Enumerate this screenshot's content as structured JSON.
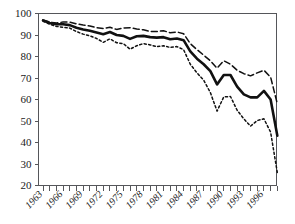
{
  "chart_data": {
    "type": "line",
    "title": "",
    "subtitle": "",
    "xlabel": "",
    "ylabel": "",
    "xlim": [
      1963,
      1998
    ],
    "ylim": [
      20,
      100
    ],
    "grid": false,
    "legend_position": "none",
    "y_ticks": [
      20,
      30,
      40,
      50,
      60,
      70,
      80,
      90,
      100
    ],
    "y_tick_labels": [
      "20",
      "30",
      "40",
      "50",
      "60",
      "70",
      "80",
      "90",
      "100"
    ],
    "x": [
      1963,
      1964,
      1965,
      1966,
      1967,
      1968,
      1969,
      1970,
      1971,
      1972,
      1973,
      1974,
      1975,
      1976,
      1977,
      1978,
      1979,
      1980,
      1981,
      1982,
      1983,
      1984,
      1985,
      1986,
      1987,
      1988,
      1989,
      1990,
      1991,
      1992,
      1993,
      1994,
      1995,
      1996,
      1997,
      1998
    ],
    "x_tick_labels": [
      "1963",
      "",
      "",
      "1966",
      "",
      "",
      "1969",
      "",
      "",
      "1972",
      "",
      "",
      "1975",
      "",
      "",
      "1978",
      "",
      "",
      "1981",
      "",
      "",
      "1984",
      "",
      "",
      "1987",
      "",
      "",
      "1990",
      "",
      "",
      "1993",
      "",
      "",
      "1996",
      "",
      ""
    ],
    "x_labeled_years": [
      "1963",
      "1966",
      "1969",
      "1972",
      "1975",
      "1978",
      "1981",
      "1984",
      "1987",
      "1990",
      "1993",
      "1996"
    ],
    "series": [
      {
        "name": "upper-confidence-bound",
        "style": "dashed",
        "color": "#111111",
        "values": [
          97.0,
          96.0,
          95.6,
          96.0,
          96.0,
          95.2,
          94.6,
          94.2,
          93.4,
          93.0,
          93.6,
          92.6,
          93.2,
          93.4,
          92.8,
          92.4,
          91.6,
          91.6,
          92.0,
          91.0,
          91.4,
          90.6,
          86.0,
          83.2,
          80.6,
          78.0,
          74.6,
          78.0,
          76.4,
          73.6,
          72.0,
          71.0,
          72.4,
          73.6,
          70.4,
          58.0
        ]
      },
      {
        "name": "point-estimate",
        "style": "solid",
        "color": "#111111",
        "values": [
          96.8,
          95.6,
          95.0,
          95.0,
          94.6,
          93.4,
          92.6,
          92.0,
          91.2,
          90.4,
          91.4,
          90.0,
          89.6,
          88.2,
          89.4,
          89.6,
          89.0,
          88.8,
          89.0,
          88.0,
          88.4,
          87.6,
          82.4,
          79.0,
          76.4,
          73.2,
          67.0,
          71.4,
          71.4,
          66.0,
          62.4,
          61.0,
          61.0,
          64.0,
          60.0,
          43.2
        ]
      },
      {
        "name": "lower-confidence-bound",
        "style": "dotted",
        "color": "#111111",
        "values": [
          96.4,
          95.0,
          94.0,
          93.6,
          93.2,
          91.6,
          90.4,
          89.6,
          88.4,
          86.6,
          88.2,
          86.4,
          86.0,
          83.4,
          85.0,
          86.0,
          85.4,
          84.6,
          85.0,
          84.2,
          84.6,
          83.2,
          76.4,
          72.4,
          69.0,
          63.2,
          54.6,
          61.2,
          61.4,
          55.0,
          51.0,
          47.6,
          50.2,
          51.0,
          44.8,
          26.0
        ]
      }
    ]
  },
  "axes": {
    "y_axis_name": "y-axis",
    "x_axis_name": "x-axis"
  }
}
